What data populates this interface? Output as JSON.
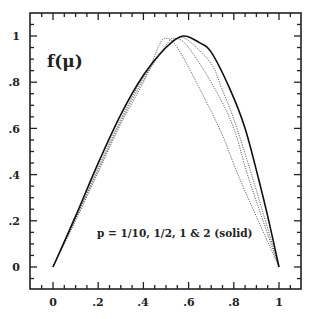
{
  "chart_data": {
    "type": "line",
    "title": "",
    "xlabel": "",
    "ylabel": "f(μ)",
    "xlim": [
      -0.1,
      1.1
    ],
    "ylim": [
      -0.095,
      1.1
    ],
    "grid": false,
    "x_ticks": [
      "0",
      ".2",
      ".4",
      ".6",
      ".8",
      "1"
    ],
    "y_ticks": [
      "0",
      ".2",
      ".4",
      ".6",
      ".8",
      "1"
    ],
    "annotation": "p = 1/10, 1/2, 1 & 2 (solid)",
    "series": [
      {
        "name": "p = 1/10",
        "style": "dotted",
        "points": [
          [
            0,
            0
          ],
          [
            0.1,
            0.2
          ],
          [
            0.2,
            0.41
          ],
          [
            0.3,
            0.62
          ],
          [
            0.4,
            0.8
          ],
          [
            0.47,
            0.96
          ],
          [
            0.5,
            0.99
          ],
          [
            0.55,
            0.95
          ],
          [
            0.65,
            0.77
          ],
          [
            0.75,
            0.57
          ],
          [
            0.827,
            0.38
          ],
          [
            1,
            0
          ]
        ]
      },
      {
        "name": "p = 1/2",
        "style": "dotted",
        "points": [
          [
            0,
            0
          ],
          [
            0.1,
            0.21
          ],
          [
            0.2,
            0.42
          ],
          [
            0.3,
            0.63
          ],
          [
            0.4,
            0.81
          ],
          [
            0.5,
            0.96
          ],
          [
            0.54,
            0.99
          ],
          [
            0.6,
            0.95
          ],
          [
            0.717,
            0.77
          ],
          [
            0.8,
            0.6
          ],
          [
            0.867,
            0.38
          ],
          [
            1,
            0
          ]
        ]
      },
      {
        "name": "p = 1",
        "style": "dotted",
        "points": [
          [
            0,
            0
          ],
          [
            0.1,
            0.21
          ],
          [
            0.2,
            0.43
          ],
          [
            0.3,
            0.64
          ],
          [
            0.4,
            0.82
          ],
          [
            0.5,
            0.95
          ],
          [
            0.55,
            0.99
          ],
          [
            0.6,
            0.98
          ],
          [
            0.7,
            0.88
          ],
          [
            0.748,
            0.77
          ],
          [
            0.8,
            0.64
          ],
          [
            0.885,
            0.38
          ],
          [
            1,
            0
          ]
        ]
      },
      {
        "name": "p = 2",
        "style": "solid",
        "points": [
          [
            0,
            0
          ],
          [
            0.1,
            0.22
          ],
          [
            0.2,
            0.45
          ],
          [
            0.3,
            0.66
          ],
          [
            0.4,
            0.83
          ],
          [
            0.5,
            0.95
          ],
          [
            0.575,
            1
          ],
          [
            0.65,
            0.97
          ],
          [
            0.7,
            0.93
          ],
          [
            0.783,
            0.77
          ],
          [
            0.85,
            0.6
          ],
          [
            0.91,
            0.38
          ],
          [
            0.95,
            0.22
          ],
          [
            1,
            0
          ]
        ]
      }
    ]
  },
  "labels": {
    "ylabel": "f(μ)",
    "annotation": "p = 1/10, 1/2, 1 & 2 (solid)",
    "x_ticks": [
      "0",
      ".2",
      ".4",
      ".6",
      ".8",
      "1"
    ],
    "y_ticks": [
      "0",
      ".2",
      ".4",
      ".6",
      ".8",
      "1"
    ]
  }
}
